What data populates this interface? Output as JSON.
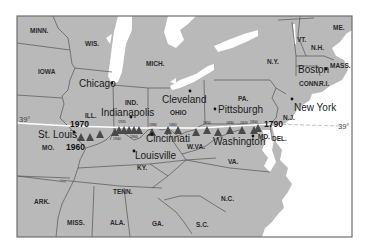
{
  "map": {
    "colors": {
      "land": "#b9b9b9",
      "water": "#ffffff",
      "border": "#555555",
      "frame": "#6e6e6e",
      "triangle": "#4a4a4a",
      "parallel_line": "#ffffff"
    },
    "parallel": {
      "label_left": "39°",
      "label_right": "39°"
    },
    "states": [
      {
        "id": "minn",
        "label": "MINN."
      },
      {
        "id": "wis",
        "label": "WIS."
      },
      {
        "id": "mich",
        "label": "MICH."
      },
      {
        "id": "iowa",
        "label": "IOWA"
      },
      {
        "id": "ill",
        "label": "ILL."
      },
      {
        "id": "ind",
        "label": "IND."
      },
      {
        "id": "ohio",
        "label": "OHIO"
      },
      {
        "id": "pa",
        "label": "PA."
      },
      {
        "id": "ny",
        "label": "N.Y."
      },
      {
        "id": "vt",
        "label": "VT."
      },
      {
        "id": "nh",
        "label": "N.H."
      },
      {
        "id": "me",
        "label": "ME."
      },
      {
        "id": "mass",
        "label": "MASS."
      },
      {
        "id": "conn",
        "label": "CONN."
      },
      {
        "id": "ri",
        "label": "R.I."
      },
      {
        "id": "nj",
        "label": "N.J."
      },
      {
        "id": "md",
        "label": "MD."
      },
      {
        "id": "del",
        "label": "DEL."
      },
      {
        "id": "wva",
        "label": "W.VA."
      },
      {
        "id": "va",
        "label": "VA."
      },
      {
        "id": "ky",
        "label": "KY."
      },
      {
        "id": "mo",
        "label": "MO."
      },
      {
        "id": "tenn",
        "label": "TENN."
      },
      {
        "id": "nc",
        "label": "N.C."
      },
      {
        "id": "ark",
        "label": "ARK."
      },
      {
        "id": "miss",
        "label": "MISS."
      },
      {
        "id": "ala",
        "label": "ALA."
      },
      {
        "id": "ga",
        "label": "GA."
      },
      {
        "id": "sc",
        "label": "S.C."
      }
    ],
    "cities": [
      {
        "id": "chicago",
        "label": "Chicago"
      },
      {
        "id": "cleveland",
        "label": "Cleveland"
      },
      {
        "id": "pittsburgh",
        "label": "Pittsburgh"
      },
      {
        "id": "boston",
        "label": "Boston"
      },
      {
        "id": "new-york",
        "label": "New York"
      },
      {
        "id": "indianapolis",
        "label": "Indianapolis"
      },
      {
        "id": "st-louis",
        "label": "St. Louis"
      },
      {
        "id": "cincinnati",
        "label": "Cincinnati"
      },
      {
        "id": "louisville",
        "label": "Louisville"
      },
      {
        "id": "washington",
        "label": "Washington"
      }
    ],
    "year_labels": {
      "y1970": "1970",
      "y1960": "1960",
      "y1790": "1790",
      "small": [
        "1920",
        "1940",
        "1900",
        "1880",
        "1860",
        "1850",
        "1830",
        "1820",
        "1800"
      ]
    }
  }
}
